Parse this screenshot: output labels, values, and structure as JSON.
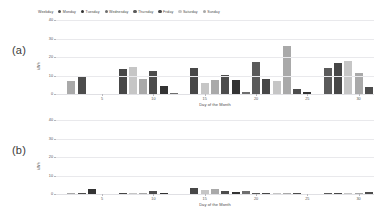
{
  "legend": {
    "title": "Weekday",
    "items": [
      {
        "label": "Monday",
        "color": "#4c4c4c"
      },
      {
        "label": "Tuesday",
        "color": "#333333"
      },
      {
        "label": "Wednesday",
        "color": "#6e6e6e"
      },
      {
        "label": "Thursday",
        "color": "#5a5a5a"
      },
      {
        "label": "Friday",
        "color": "#474747"
      },
      {
        "label": "Saturday",
        "color": "#c6c6c6"
      },
      {
        "label": "Sunday",
        "color": "#a9a9a9"
      }
    ]
  },
  "panels": [
    {
      "letter": "(a)"
    },
    {
      "letter": "(b)"
    }
  ],
  "chart_data": [
    {
      "type": "bar",
      "title": "",
      "panel": "(a)",
      "xlabel": "Day of the Month",
      "ylabel": "kWh",
      "ylim": [
        0,
        40
      ],
      "yticks": [
        0,
        10,
        20,
        30,
        40
      ],
      "xlim": [
        0.5,
        31.5
      ],
      "xticks": [
        5,
        10,
        15,
        20,
        25,
        30
      ],
      "grid": true,
      "legend_position": "top-left",
      "categories": [
        1,
        2,
        3,
        4,
        5,
        6,
        7,
        8,
        9,
        10,
        11,
        12,
        13,
        14,
        15,
        16,
        17,
        18,
        19,
        20,
        21,
        22,
        23,
        24,
        25,
        26,
        27,
        28,
        29,
        30,
        31
      ],
      "weekday": [
        "Saturday",
        "Sunday",
        "Monday",
        "Tuesday",
        "Wednesday",
        "Thursday",
        "Friday",
        "Saturday",
        "Sunday",
        "Monday",
        "Tuesday",
        "Wednesday",
        "Thursday",
        "Friday",
        "Saturday",
        "Sunday",
        "Monday",
        "Tuesday",
        "Wednesday",
        "Thursday",
        "Friday",
        "Saturday",
        "Sunday",
        "Monday",
        "Tuesday",
        "Wednesday",
        "Thursday",
        "Friday",
        "Saturday",
        "Sunday",
        "Monday"
      ],
      "values": [
        0,
        7.2,
        9.5,
        0,
        0,
        0,
        13.5,
        14.7,
        8.0,
        12.3,
        4.4,
        0.3,
        0,
        13.9,
        6.2,
        7.4,
        10.5,
        7.5,
        1.3,
        17.4,
        8.1,
        7.2,
        25.8,
        2.6,
        1.1,
        0,
        14.0,
        16.8,
        17.6,
        11.1,
        3.6
      ],
      "bar_colors": [
        "#c6c6c6",
        "#a9a9a9",
        "#4c4c4c",
        "#333333",
        "#6e6e6e",
        "#5a5a5a",
        "#474747",
        "#c6c6c6",
        "#a9a9a9",
        "#4c4c4c",
        "#333333",
        "#6e6e6e",
        "#5a5a5a",
        "#474747",
        "#c6c6c6",
        "#a9a9a9",
        "#4c4c4c",
        "#333333",
        "#6e6e6e",
        "#5a5a5a",
        "#474747",
        "#c6c6c6",
        "#a9a9a9",
        "#4c4c4c",
        "#333333",
        "#6e6e6e",
        "#5a5a5a",
        "#474747",
        "#c6c6c6",
        "#a9a9a9",
        "#4c4c4c"
      ]
    },
    {
      "type": "bar",
      "title": "",
      "panel": "(b)",
      "xlabel": "Day of the Month",
      "ylabel": "kWh",
      "ylim": [
        0,
        40
      ],
      "yticks": [
        0,
        10,
        20,
        30,
        40
      ],
      "xlim": [
        0.5,
        31.5
      ],
      "xticks": [
        5,
        10,
        15,
        20,
        25,
        30
      ],
      "grid": true,
      "legend_position": "none",
      "categories": [
        1,
        2,
        3,
        4,
        5,
        6,
        7,
        8,
        9,
        10,
        11,
        12,
        13,
        14,
        15,
        16,
        17,
        18,
        19,
        20,
        21,
        22,
        23,
        24,
        25,
        26,
        27,
        28,
        29,
        30,
        31
      ],
      "weekday": [
        "Saturday",
        "Sunday",
        "Monday",
        "Tuesday",
        "Wednesday",
        "Thursday",
        "Friday",
        "Saturday",
        "Sunday",
        "Monday",
        "Tuesday",
        "Wednesday",
        "Thursday",
        "Friday",
        "Saturday",
        "Sunday",
        "Monday",
        "Tuesday",
        "Wednesday",
        "Thursday",
        "Friday",
        "Saturday",
        "Sunday",
        "Monday",
        "Tuesday",
        "Wednesday",
        "Thursday",
        "Friday",
        "Saturday",
        "Sunday",
        "Monday"
      ],
      "values": [
        0,
        0.3,
        0.5,
        2.5,
        0,
        0,
        0.2,
        0.3,
        0.8,
        1.5,
        0.3,
        0,
        0,
        3.4,
        2.0,
        2.6,
        1.8,
        1.0,
        1.5,
        0.4,
        0.3,
        0.3,
        0.3,
        0.3,
        0,
        0,
        0.4,
        0.2,
        0.2,
        0.5,
        1.2
      ],
      "bar_colors": [
        "#c6c6c6",
        "#a9a9a9",
        "#4c4c4c",
        "#333333",
        "#6e6e6e",
        "#5a5a5a",
        "#474747",
        "#c6c6c6",
        "#a9a9a9",
        "#4c4c4c",
        "#333333",
        "#6e6e6e",
        "#5a5a5a",
        "#474747",
        "#c6c6c6",
        "#a9a9a9",
        "#4c4c4c",
        "#333333",
        "#6e6e6e",
        "#5a5a5a",
        "#474747",
        "#c6c6c6",
        "#a9a9a9",
        "#4c4c4c",
        "#333333",
        "#6e6e6e",
        "#5a5a5a",
        "#474747",
        "#c6c6c6",
        "#a9a9a9",
        "#4c4c4c"
      ]
    }
  ]
}
